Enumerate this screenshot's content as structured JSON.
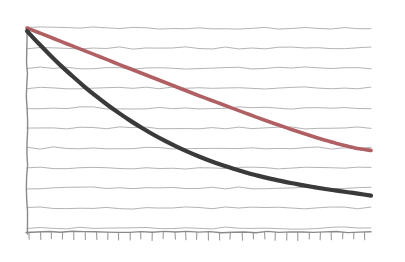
{
  "chart_data": {
    "type": "line",
    "title": "",
    "subtitle": "",
    "xlabel": "",
    "ylabel": "",
    "grid": "horizontal",
    "legend": "none",
    "style": "hand-drawn-sketch",
    "background_color": "#ffffff",
    "grid_color": "#8e8e8e",
    "axis_color": "#8a8a8a",
    "xlim": [
      0,
      30
    ],
    "ylim": [
      0,
      10
    ],
    "x_tick_count": 31,
    "y_gridline_count": 11,
    "x": [
      0,
      1,
      2,
      3,
      4,
      5,
      6,
      7,
      8,
      9,
      10,
      11,
      12,
      13,
      14,
      15,
      16,
      17,
      18,
      19,
      20,
      21,
      22,
      23,
      24,
      25,
      26,
      27,
      28,
      29,
      30
    ],
    "series": [
      {
        "name": "series-red",
        "color": "#b05f63",
        "stroke_width": 3.6,
        "values": [
          10.0,
          9.78,
          9.56,
          9.33,
          9.11,
          8.89,
          8.67,
          8.45,
          8.22,
          8.0,
          7.78,
          7.56,
          7.34,
          7.12,
          6.9,
          6.68,
          6.47,
          6.26,
          6.05,
          5.84,
          5.63,
          5.43,
          5.23,
          5.04,
          4.85,
          4.67,
          4.5,
          4.34,
          4.2,
          4.08,
          4.0
        ],
        "start_point": [
          0,
          10.0
        ],
        "end_point": [
          30,
          4.0
        ]
      },
      {
        "name": "series-dark",
        "color": "#3a3a3a",
        "stroke_width": 4.2,
        "values": [
          9.85,
          9.25,
          8.68,
          8.13,
          7.62,
          7.13,
          6.67,
          6.24,
          5.84,
          5.46,
          5.11,
          4.78,
          4.48,
          4.2,
          3.94,
          3.7,
          3.48,
          3.28,
          3.1,
          2.93,
          2.78,
          2.64,
          2.52,
          2.4,
          2.3,
          2.2,
          2.11,
          2.03,
          1.95,
          1.87,
          1.78
        ],
        "start_point": [
          0,
          9.85
        ],
        "end_point": [
          30,
          1.78
        ]
      }
    ],
    "annotations": [],
    "tick_labels": {
      "x": [],
      "y": []
    }
  },
  "geometry": {
    "plot_left": 27,
    "plot_right": 371,
    "plot_top": 28,
    "plot_bottom": 232,
    "gridline_spacing": 20,
    "tick_spacing": 11.2,
    "tick_length": 7
  }
}
